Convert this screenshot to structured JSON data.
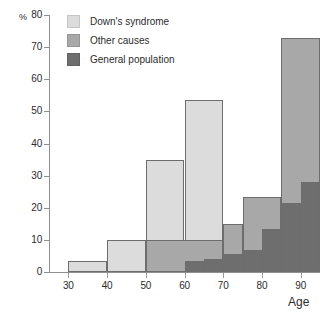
{
  "chart_data": {
    "type": "bar",
    "title": "",
    "subtitle": "",
    "xlabel": "Age",
    "ylabel": "%",
    "xlim": [
      25,
      95
    ],
    "ylim": [
      0,
      80
    ],
    "grid": false,
    "legend_position": "top-left",
    "x_ticks": [
      30,
      40,
      50,
      60,
      70,
      80,
      90
    ],
    "y_ticks": [
      0,
      10,
      20,
      30,
      40,
      50,
      60,
      70,
      80
    ],
    "bin_width": 5,
    "note": "Overlaid step histogram; each series drawn as 5-year age bins",
    "series": [
      {
        "name": "Down's syndrome",
        "color": "#dcdcdc",
        "bins": [
          {
            "x0": 30,
            "x1": 40,
            "value": 3.5
          },
          {
            "x0": 40,
            "x1": 50,
            "value": 10.0
          },
          {
            "x0": 50,
            "x1": 60,
            "value": 35.0
          },
          {
            "x0": 60,
            "x1": 70,
            "value": 53.5
          }
        ]
      },
      {
        "name": "Other causes",
        "color": "#a8a8a8",
        "bins": [
          {
            "x0": 50,
            "x1": 70,
            "value": 10.0
          },
          {
            "x0": 70,
            "x1": 75,
            "value": 14.8
          },
          {
            "x0": 75,
            "x1": 85,
            "value": 23.3
          },
          {
            "x0": 85,
            "x1": 95,
            "value": 73.0
          }
        ]
      },
      {
        "name": "General population",
        "color": "#6e6e6e",
        "bins": [
          {
            "x0": 60,
            "x1": 65,
            "value": 3.3
          },
          {
            "x0": 65,
            "x1": 70,
            "value": 4.2
          },
          {
            "x0": 70,
            "x1": 75,
            "value": 5.7
          },
          {
            "x0": 75,
            "x1": 80,
            "value": 7.0
          },
          {
            "x0": 80,
            "x1": 85,
            "value": 13.3
          },
          {
            "x0": 85,
            "x1": 90,
            "value": 21.5
          },
          {
            "x0": 90,
            "x1": 95,
            "value": 28.0
          }
        ]
      }
    ]
  },
  "axes": {
    "y_axis_label": "%",
    "x_axis_label": "Age",
    "y_tick_labels": [
      "80",
      "70",
      "60",
      "50",
      "40",
      "30",
      "20",
      "10",
      "0"
    ],
    "x_tick_labels": [
      "30",
      "40",
      "50",
      "60",
      "70",
      "80",
      "90"
    ]
  },
  "legend": {
    "items": [
      {
        "label": "Down's syndrome",
        "color": "#dcdcdc"
      },
      {
        "label": "Other causes",
        "color": "#a8a8a8"
      },
      {
        "label": "General population",
        "color": "#6e6e6e"
      }
    ]
  }
}
